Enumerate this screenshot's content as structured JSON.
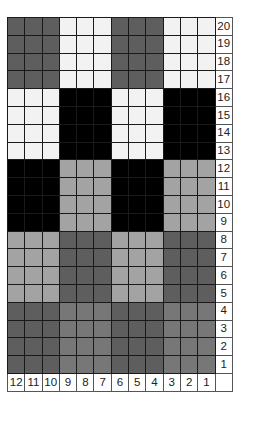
{
  "chart_data": {
    "type": "heatmap",
    "title": "",
    "columns": [
      12,
      11,
      10,
      9,
      8,
      7,
      6,
      5,
      4,
      3,
      2,
      1
    ],
    "rows_top_to_bottom": [
      20,
      19,
      18,
      17,
      16,
      15,
      14,
      13,
      12,
      11,
      10,
      9,
      8,
      7,
      6,
      5,
      4,
      3,
      2,
      1
    ],
    "palette": {
      "W": "#f2f2f2",
      "K": "#000000",
      "D": "#5e5e5e",
      "M": "#777777",
      "L": "#a3a3a3"
    },
    "blocks": [
      {
        "rows": [
          17,
          20
        ],
        "pattern": [
          "D",
          "W",
          "D",
          "W"
        ]
      },
      {
        "rows": [
          13,
          16
        ],
        "pattern": [
          "W",
          "K",
          "W",
          "K"
        ]
      },
      {
        "rows": [
          9,
          12
        ],
        "pattern": [
          "K",
          "L",
          "K",
          "L"
        ]
      },
      {
        "rows": [
          5,
          8
        ],
        "pattern": [
          "L",
          "D",
          "L",
          "D"
        ]
      },
      {
        "rows": [
          1,
          4
        ],
        "pattern": [
          "D",
          "M",
          "D",
          "M"
        ]
      }
    ],
    "block_width_stitches": 3,
    "xlabel": "",
    "ylabel": ""
  },
  "labels": {
    "row_numbers": [
      "20",
      "19",
      "18",
      "17",
      "16",
      "15",
      "14",
      "13",
      "12",
      "11",
      "10",
      "9",
      "8",
      "7",
      "6",
      "5",
      "4",
      "3",
      "2",
      "1"
    ],
    "col_numbers": [
      "12",
      "11",
      "10",
      "9",
      "8",
      "7",
      "6",
      "5",
      "4",
      "3",
      "2",
      "1"
    ]
  }
}
